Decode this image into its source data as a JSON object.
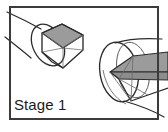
{
  "figure": {
    "caption": "Stage 1",
    "panel": {
      "frame_color": "#3b3b3b",
      "background_color": "#ffffff",
      "frame_x": 10,
      "frame_y": 7,
      "frame_width": 148,
      "frame_height": 112,
      "frame_stroke_width": 2
    },
    "palette": {
      "outline": "#2b2b2b",
      "thin_outline": "#555555",
      "shaded_face": "#9b9b9b",
      "shaded_face_dark": "#8d8d8d",
      "caption_color": "#1b1b1b",
      "page_background": "#ffffff"
    },
    "objects": [
      {
        "name": "left-assembly",
        "description": "Hexagonal prism end seated inside a cylindrical tube, viewed at an angle",
        "parts": [
          "cylinder-tube",
          "hexagonal-prism",
          "shaded-top-face"
        ]
      },
      {
        "name": "right-assembly",
        "description": "Cylindrical tube end-on with a hexagonal prism passing through it",
        "parts": [
          "cylinder-tube",
          "hexagonal-prism",
          "shaded-top-face"
        ]
      }
    ]
  }
}
